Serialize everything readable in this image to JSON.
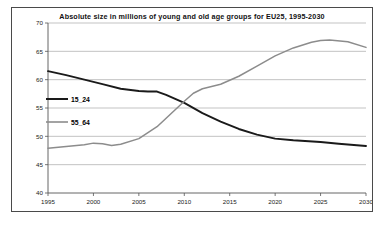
{
  "chart_data": {
    "type": "line",
    "title": "Absolute size in millions of young and old age groups for EU25, 1995-2030",
    "xlabel": "",
    "ylabel": "",
    "x": [
      1995,
      2000,
      2005,
      2010,
      2015,
      2020,
      2025,
      2030
    ],
    "xlim": [
      1995,
      2030
    ],
    "ylim": [
      40,
      70
    ],
    "yticks": [
      40,
      45,
      50,
      55,
      60,
      65,
      70
    ],
    "xticks": [
      1995,
      2000,
      2005,
      2010,
      2015,
      2020,
      2025,
      2030
    ],
    "grid": "horizontal",
    "legend_position": "inside-left",
    "series": [
      {
        "name": "15_24",
        "color": "#1a1a1a",
        "x": [
          1995,
          1997,
          1999,
          2001,
          2003,
          2005,
          2006,
          2007,
          2008,
          2009,
          2010,
          2012,
          2014,
          2016,
          2018,
          2020,
          2022,
          2025,
          2027,
          2030
        ],
        "values": [
          61.5,
          60.8,
          60.0,
          59.2,
          58.4,
          58.0,
          57.9,
          57.9,
          57.3,
          56.6,
          55.9,
          54.1,
          52.6,
          51.3,
          50.3,
          49.6,
          49.3,
          49.0,
          48.7,
          48.3
        ]
      },
      {
        "name": "55_64",
        "color": "#8c8c8c",
        "x": [
          1995,
          1997,
          1999,
          2000,
          2001,
          2002,
          2003,
          2005,
          2007,
          2009,
          2010,
          2011,
          2012,
          2014,
          2016,
          2018,
          2020,
          2022,
          2024,
          2025,
          2026,
          2028,
          2030
        ],
        "values": [
          47.9,
          48.2,
          48.5,
          48.8,
          48.7,
          48.4,
          48.6,
          49.6,
          51.7,
          54.7,
          56.2,
          57.6,
          58.4,
          59.2,
          60.6,
          62.4,
          64.2,
          65.6,
          66.6,
          66.9,
          67.0,
          66.7,
          65.7
        ]
      }
    ]
  }
}
